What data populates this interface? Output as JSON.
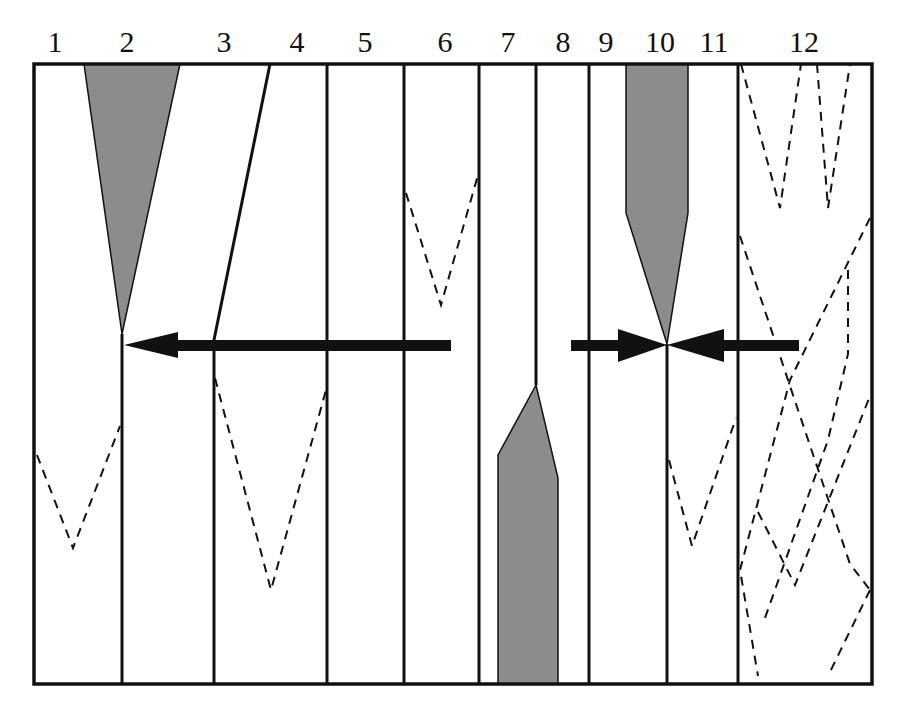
{
  "diagram": {
    "type": "schematic strip diagram",
    "column_labels": [
      {
        "text": "1",
        "x": 55
      },
      {
        "text": "2",
        "x": 127
      },
      {
        "text": "3",
        "x": 224
      },
      {
        "text": "4",
        "x": 297
      },
      {
        "text": "5",
        "x": 365
      },
      {
        "text": "6",
        "x": 445
      },
      {
        "text": "7",
        "x": 508
      },
      {
        "text": "8",
        "x": 563
      },
      {
        "text": "9",
        "x": 606
      },
      {
        "text": "10",
        "x": 660
      },
      {
        "text": "11",
        "x": 714
      },
      {
        "text": "12",
        "x": 804
      }
    ],
    "colors": {
      "line": "#111111",
      "fill_gray": "#8c8c8c",
      "background": "#ffffff"
    },
    "arrows": [
      {
        "id": "arrow-left",
        "direction": "left",
        "from_x": 450,
        "to_x": 122,
        "y": 345
      },
      {
        "id": "arrow-right-in",
        "direction": "right",
        "from_x": 572,
        "to_x": 667,
        "y": 345
      },
      {
        "id": "arrow-left-in",
        "direction": "left",
        "from_x": 798,
        "to_x": 667,
        "y": 345
      }
    ]
  }
}
